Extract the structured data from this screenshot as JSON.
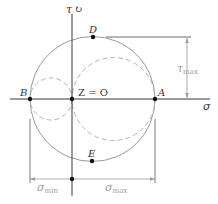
{
  "diagram": {
    "type": "mohr-circle",
    "axes": {
      "horizontal": "σ",
      "vertical": "τ",
      "vertical_rotation_symbol": "↻"
    },
    "points": {
      "B": "B",
      "origin": "Z = O",
      "A": "A",
      "D": "D",
      "E": "E"
    },
    "dimensions": {
      "tau_max": {
        "symbol": "τ",
        "subscript": "max"
      },
      "sigma_min": {
        "symbol": "σ",
        "subscript": "min"
      },
      "sigma_max": {
        "symbol": "σ",
        "subscript": "max"
      }
    },
    "colors": {
      "axis": "#3a3a3a",
      "circle": "#9a9a9a",
      "dashed_circle": "#b4b4b4",
      "dimension": "#8a8a8a",
      "point": "#111111"
    }
  }
}
